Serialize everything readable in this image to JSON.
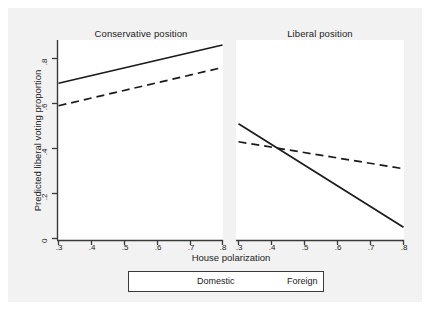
{
  "chart_data": {
    "type": "line",
    "title": "",
    "xlabel": "House polarization",
    "ylabel": "Predicted liberal voting proportion",
    "xlim": [
      0.3,
      0.8
    ],
    "ylim": [
      0,
      0.88
    ],
    "grid": false,
    "legend_position": "bottom",
    "x_ticks": [
      ".3",
      ".4",
      ".5",
      ".6",
      ".7",
      ".8"
    ],
    "x_tick_values": [
      0.3,
      0.4,
      0.5,
      0.6,
      0.7,
      0.8
    ],
    "y_ticks": [
      "0",
      ".2",
      ".4",
      ".6",
      ".8"
    ],
    "y_tick_values": [
      0,
      0.2,
      0.4,
      0.6,
      0.8
    ],
    "panels": [
      {
        "title": "Conservative position",
        "series": [
          {
            "name": "Domestic",
            "style": "solid",
            "x": [
              0.3,
              0.8
            ],
            "values": [
              0.69,
              0.86
            ]
          },
          {
            "name": "Foreign",
            "style": "dashed",
            "x": [
              0.3,
              0.8
            ],
            "values": [
              0.59,
              0.76
            ]
          }
        ]
      },
      {
        "title": "Liberal position",
        "series": [
          {
            "name": "Domestic",
            "style": "solid",
            "x": [
              0.3,
              0.8
            ],
            "values": [
              0.51,
              0.05
            ]
          },
          {
            "name": "Foreign",
            "style": "dashed",
            "x": [
              0.3,
              0.8
            ],
            "values": [
              0.43,
              0.31
            ]
          }
        ]
      }
    ],
    "legend": [
      {
        "label": "Domestic",
        "style": "solid"
      },
      {
        "label": "Foreign",
        "style": "dashed"
      }
    ],
    "colors": {
      "line": "#1a1a1a",
      "axis": "#3a3a3a",
      "text": "#222222",
      "panel_background": "#ffffff",
      "figure_background": "#f2f2f2"
    }
  },
  "axes": {
    "y_label": "Predicted liberal voting proportion",
    "x_label": "House polarization",
    "y_tick_0": "0",
    "y_tick_1": ".2",
    "y_tick_2": ".4",
    "y_tick_3": ".6",
    "y_tick_4": ".8",
    "x_tick_0": ".3",
    "x_tick_1": ".4",
    "x_tick_2": ".5",
    "x_tick_3": ".6",
    "x_tick_4": ".7",
    "x_tick_5": ".8"
  },
  "panel_titles": {
    "left": "Conservative position",
    "right": "Liberal position"
  },
  "legend": {
    "domestic_label": "Domestic",
    "foreign_label": "Foreign"
  }
}
